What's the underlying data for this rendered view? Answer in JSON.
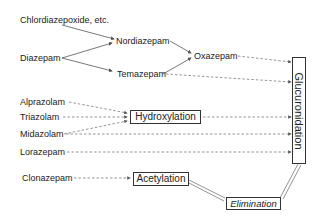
{
  "nodes": {
    "chlordiazepoxide": "Chlordiazepoxide, etc.",
    "diazepam": "Diazepam",
    "nordiazepam": "Nordiazepam",
    "temazepam": "Temazepam",
    "oxazepam": "Oxazepam",
    "alprazolam": "Alprazolam",
    "triazolam": "Triazolam",
    "midazolam": "Midazolam",
    "lorazepam": "Lorazepam",
    "clonazepam": "Clonazepam"
  },
  "processes": {
    "hydroxylation": "Hydroxylation",
    "acetylation": "Acetylation",
    "glucuronidation": "Glucuronidation",
    "elimination": "Elimination"
  },
  "colors": {
    "line": "#555555",
    "text": "#222222"
  }
}
